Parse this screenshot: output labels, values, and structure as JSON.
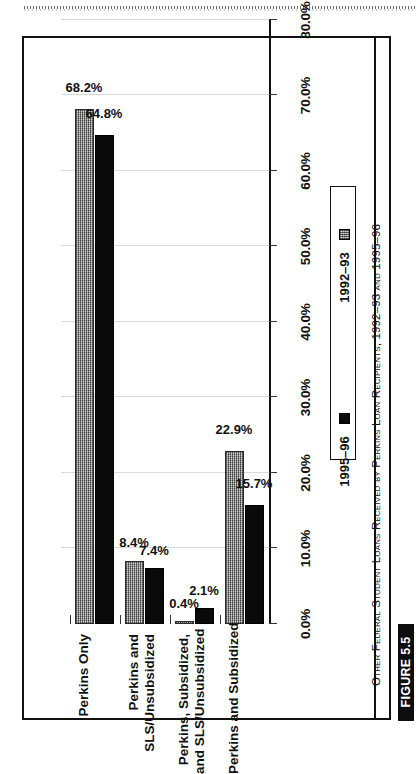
{
  "figure": {
    "badge_label": "FIGURE 5.5",
    "caption": "Other Federal Student Loans Received by Perkins Loan Recipients, 1992–93 and 1995–96"
  },
  "legend": {
    "items": [
      {
        "label": "1995–96",
        "swatch": "black-square-icon",
        "color": "#0a0a0a"
      },
      {
        "label": "1992–93",
        "swatch": "gray-textured-square-icon",
        "color": "#9c9c9c"
      }
    ]
  },
  "axis": {
    "ticks": [
      "0.0%",
      "10.0%",
      "20.0%",
      "30.0%",
      "40.0%",
      "50.0%",
      "60.0%",
      "70.0%",
      "80.0%"
    ]
  },
  "chart_data": {
    "type": "bar",
    "title": "Other Federal Student Loans Received by Perkins Loan Recipients, 1992–93 and 1995–96",
    "orientation": "vertical-bars-rotated-90",
    "categories": [
      "Perkins and Subsidized",
      "Perkins, Subsidized,\nand SLS/Unsubsidized",
      "Perkins and\nSLS/Unsubsidized",
      "Perkins Only"
    ],
    "series": [
      {
        "name": "1995–96",
        "color": "#9c9c9c",
        "values": [
          68.2,
          8.4,
          0.4,
          22.9
        ],
        "labels": [
          "68.2%",
          "8.4%",
          "0.4%",
          "22.9%"
        ]
      },
      {
        "name": "1992–93",
        "color": "#0a0a0a",
        "values": [
          64.8,
          7.4,
          2.1,
          15.7
        ],
        "labels": [
          "64.8%",
          "7.4%",
          "2.1%",
          "15.7%"
        ]
      }
    ],
    "xlabel": "",
    "ylabel": "",
    "ylim": [
      0,
      80
    ],
    "ytick_labels": [
      "0.0%",
      "10.0%",
      "20.0%",
      "30.0%",
      "40.0%",
      "50.0%",
      "60.0%",
      "70.0%",
      "80.0%"
    ],
    "grid": false,
    "legend_position": "right"
  }
}
